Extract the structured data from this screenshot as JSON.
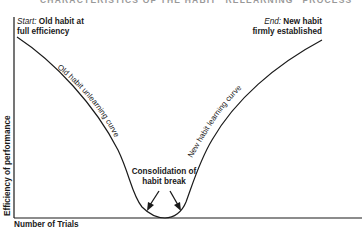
{
  "figure": {
    "title": "CHARACTERISTICS OF THE HABIT \"RELEARNING\" PROCESS",
    "start_label": {
      "prefix": "Start:",
      "line1": " Old habit at",
      "line2": "full efficiency"
    },
    "end_label": {
      "prefix": "End:",
      "line1": " New habit",
      "line2": "firmly established"
    },
    "left_curve_label": "Old habit unlearning curve",
    "right_curve_label": "New habit learning curve",
    "bottom_label": {
      "line1": "Consolidation of",
      "line2": "habit break"
    },
    "y_axis_label": "Efficiency of performance",
    "x_axis_label": "Number of Trials",
    "colors": {
      "line": "#1a1a1a",
      "background": "#ffffff"
    }
  }
}
